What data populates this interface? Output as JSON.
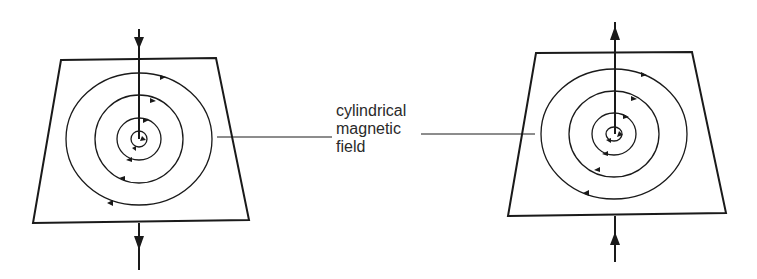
{
  "diagram": {
    "label_lines": [
      "cylindrical",
      "magnetic",
      "field"
    ],
    "stroke_color": "#1a1a1a",
    "left_panel": {
      "current_direction": "down",
      "field_direction": "clockwise",
      "plane": [
        [
          61,
          60
        ],
        [
          216,
          58
        ],
        [
          249,
          220
        ],
        [
          33,
          223
        ]
      ],
      "wire_x": 139,
      "center": [
        139,
        139
      ],
      "radii": [
        [
          8,
          8
        ],
        [
          22,
          21
        ],
        [
          44,
          44
        ],
        [
          73,
          66
        ]
      ]
    },
    "right_panel": {
      "current_direction": "up",
      "field_direction": "counterclockwise",
      "plane": [
        [
          536,
          53
        ],
        [
          692,
          52
        ],
        [
          726,
          213
        ],
        [
          508,
          216
        ]
      ],
      "wire_x": 615,
      "center": [
        614,
        134
      ],
      "radii": [
        [
          8,
          7
        ],
        [
          22,
          21
        ],
        [
          45,
          43
        ],
        [
          73,
          65
        ]
      ]
    }
  }
}
